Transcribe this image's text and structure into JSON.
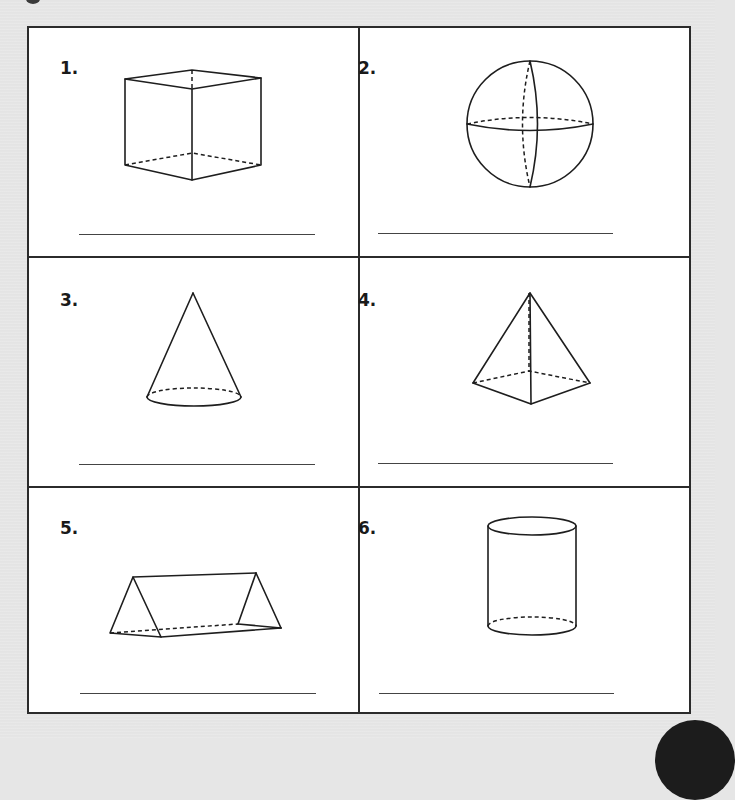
{
  "worksheet": {
    "cells": [
      {
        "number": "1.",
        "shape": "cube"
      },
      {
        "number": "2.",
        "shape": "sphere"
      },
      {
        "number": "3.",
        "shape": "cone"
      },
      {
        "number": "4.",
        "shape": "square-pyramid"
      },
      {
        "number": "5.",
        "shape": "triangular-prism"
      },
      {
        "number": "6.",
        "shape": "cylinder"
      }
    ],
    "answers": [
      "",
      "",
      "",
      "",
      "",
      ""
    ]
  },
  "colors": {
    "background": "#e6e6e6",
    "paper": "#ffffff",
    "ink": "#1e1e1e",
    "border": "#2b2b2b"
  }
}
